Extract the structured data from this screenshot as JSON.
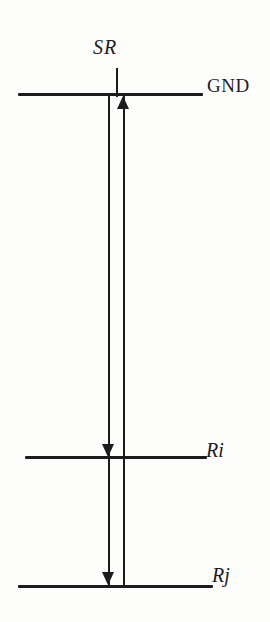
{
  "diagram": {
    "type": "level-transition-diagram",
    "labels": {
      "sr": "SR",
      "gnd": "GND",
      "ri": "Ri",
      "rj": "Rj"
    },
    "levels": [
      {
        "id": "gnd",
        "label": "GND",
        "position": "top"
      },
      {
        "id": "ri",
        "label": "Ri",
        "position": "middle"
      },
      {
        "id": "rj",
        "label": "Rj",
        "position": "bottom"
      }
    ],
    "transitions": [
      {
        "direction": "down",
        "from": "GND",
        "to": "Ri"
      },
      {
        "direction": "down",
        "from": "Ri",
        "to": "Rj"
      },
      {
        "direction": "up",
        "from": "Rj",
        "to": "GND"
      }
    ],
    "marker": {
      "label": "SR",
      "attached_to": "GND",
      "position": "top-center"
    },
    "colors": {
      "ink": "#1c1c1c",
      "background": "#fdfdfb"
    }
  }
}
